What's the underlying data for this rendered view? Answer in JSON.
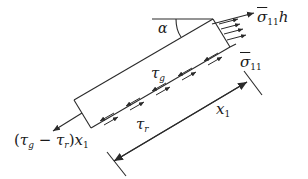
{
  "diagram": {
    "type": "free-body diagram",
    "labels": {
      "alpha": "α",
      "sigma_h": {
        "symbol": "σ̄",
        "subscript": "11",
        "suffix": "h"
      },
      "sigma": {
        "symbol": "σ̄",
        "subscript": "11"
      },
      "tau_g": {
        "symbol": "τ",
        "subscript": "g"
      },
      "tau_r": {
        "symbol": "τ",
        "subscript": "r"
      },
      "left_force": {
        "open": "(",
        "tau1": "τ",
        "sub1": "g",
        "minus": " − ",
        "tau2": "τ",
        "sub2": "r",
        "close": ")",
        "x": "x",
        "xsub": "1"
      },
      "x1": {
        "symbol": "x",
        "subscript": "1"
      }
    },
    "colors": {
      "stroke": "#2a2a2a",
      "text": "#1a1a1a",
      "background": "#ffffff"
    }
  }
}
